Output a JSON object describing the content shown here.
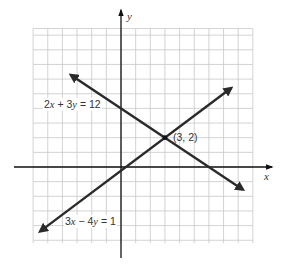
{
  "chart_data": {
    "type": "line",
    "title": "",
    "xlabel": "x",
    "ylabel": "y",
    "xlim": [
      -6,
      9
    ],
    "ylim": [
      -5,
      9
    ],
    "grid": true,
    "grid_step": 1,
    "series": [
      {
        "name": "2x + 3y = 12",
        "equation": "2x + 3y = 12",
        "slope": -0.6667,
        "y_intercept": 4,
        "x": [
          -3.4,
          8.3
        ],
        "y": [
          6.27,
          -1.53
        ],
        "arrows": "both"
      },
      {
        "name": "3x - 4y = 1",
        "equation": "3x − 4y = 1",
        "slope": 0.75,
        "y_intercept": -0.25,
        "x": [
          -5.5,
          7.5
        ],
        "y": [
          -4.375,
          5.375
        ],
        "arrows": "both"
      }
    ],
    "annotations": [
      {
        "text": "(3, 2)",
        "x": 3,
        "y": 2,
        "type": "intersection-point"
      },
      {
        "text": "2x + 3y = 12",
        "anchor_x": -5,
        "anchor_y": 4,
        "type": "line-label"
      },
      {
        "text": "3x − 4y = 1",
        "anchor_x": -3.5,
        "anchor_y": -4,
        "type": "line-label"
      }
    ]
  },
  "labels": {
    "x_axis": "x",
    "y_axis": "y",
    "line1": {
      "coef_x": "2",
      "op": " + ",
      "coef_y": "3",
      "rhs": " = 12"
    },
    "line2": {
      "coef_x": "3",
      "op": " − ",
      "coef_y": "4",
      "rhs": " = 1"
    },
    "intersection": "(3, 2)"
  },
  "colors": {
    "grid": "#c8c8c8",
    "axis": "#111111",
    "line": "#2a2a2a",
    "text": "#333333",
    "background": "#ffffff"
  }
}
